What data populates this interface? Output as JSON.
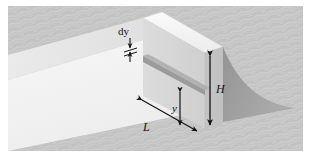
{
  "figure": {
    "type": "technical-illustration",
    "width": 311,
    "height": 163,
    "labels": {
      "dy": "dy",
      "H": "H",
      "y": "y",
      "L": "L"
    },
    "label_meanings": {
      "dy": "differential strip thickness",
      "H": "total wall height",
      "y": "depth of strip below top of wall",
      "L": "wall length"
    },
    "colors": {
      "background_texture": "#c9c9c9",
      "background_texture_alt": "#c2c2c2",
      "page_white": "#ffffff",
      "channel_floor": "#f2f2f2",
      "channel_side": "#e8e8e8",
      "wall_top_face": "#f7f7f7",
      "wall_front_face": "#d6d6d6",
      "wall_back_face": "#bdbdbd",
      "strip_face": "#9b9b9b",
      "strip_edge": "#8a8a8a",
      "jet_shape": "#a0a0a0",
      "line_ink": "#141414"
    },
    "elements": [
      "background-texture-panel",
      "channel-floor",
      "channel-left-wall",
      "dam-wall-top-face",
      "dam-wall-front-face",
      "dam-wall-side-face",
      "differential-strip",
      "water-jet-curve",
      "dy-dimension-arrows",
      "H-dimension-arrow",
      "y-dimension-arrow",
      "L-dimension-arrow"
    ]
  }
}
